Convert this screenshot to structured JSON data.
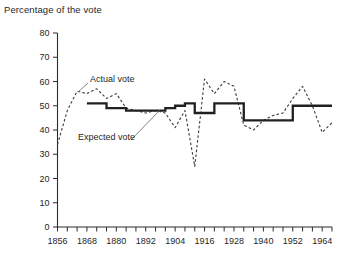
{
  "chart_data": {
    "type": "line",
    "title": "Percentage of the vote",
    "xlabel": "",
    "ylabel": "Percentage of the vote",
    "xlim": [
      1856,
      1968
    ],
    "ylim": [
      0,
      80
    ],
    "y_ticks": [
      0,
      10,
      20,
      30,
      40,
      50,
      60,
      70,
      80
    ],
    "x_ticks": [
      1856,
      1860,
      1864,
      1868,
      1872,
      1876,
      1880,
      1884,
      1888,
      1892,
      1896,
      1900,
      1904,
      1908,
      1912,
      1916,
      1920,
      1924,
      1928,
      1932,
      1936,
      1940,
      1944,
      1948,
      1952,
      1956,
      1960,
      1964,
      1968
    ],
    "x_tick_labels": [
      "1856",
      "1868",
      "1880",
      "1892",
      "1904",
      "1916",
      "1928",
      "1940",
      "1952",
      "1964"
    ],
    "x_tick_label_values": [
      1856,
      1868,
      1880,
      1892,
      1904,
      1916,
      1928,
      1940,
      1952,
      1964
    ],
    "grid": false,
    "legend_position": "inline-annotations",
    "series": [
      {
        "name": "Actual vote",
        "style": "dashed",
        "color": "#3a3a3a",
        "x": [
          1856,
          1860,
          1864,
          1868,
          1872,
          1876,
          1880,
          1884,
          1888,
          1892,
          1896,
          1900,
          1904,
          1908,
          1912,
          1916,
          1920,
          1924,
          1928,
          1932,
          1936,
          1940,
          1944,
          1948,
          1952,
          1956,
          1960,
          1964,
          1968
        ],
        "values": [
          34,
          48,
          56,
          55,
          57,
          53,
          55,
          49,
          48,
          47,
          48,
          47,
          41,
          48,
          25,
          61,
          55,
          60,
          58,
          42,
          40,
          44,
          46,
          47,
          53,
          58,
          50,
          39,
          43
        ]
      },
      {
        "name": "Expected vote",
        "style": "solid-step",
        "color": "#231f20",
        "x": [
          1868,
          1872,
          1876,
          1880,
          1884,
          1888,
          1892,
          1896,
          1900,
          1904,
          1908,
          1912,
          1916,
          1920,
          1924,
          1928,
          1932,
          1936,
          1940,
          1944,
          1948,
          1952,
          1956,
          1960,
          1964,
          1968
        ],
        "values": [
          51,
          51,
          49,
          49,
          48,
          48,
          48,
          48,
          49,
          50,
          51,
          47,
          47,
          51,
          51,
          51,
          44,
          44,
          44,
          44,
          44,
          50,
          50,
          50,
          50,
          50
        ]
      }
    ],
    "annotations": [
      {
        "text": "Actual vote",
        "x": 1868,
        "y": 62
      },
      {
        "text": "Expected vote",
        "x": 1864,
        "y": 38
      }
    ]
  },
  "labels": {
    "title": "Percentage of the vote",
    "actual_vote": "Actual vote",
    "expected_vote": "Expected vote"
  }
}
